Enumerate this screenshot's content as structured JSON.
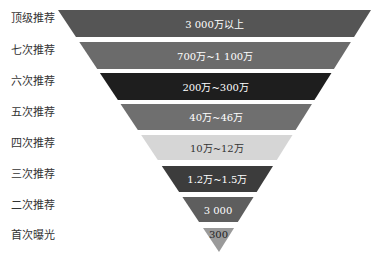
{
  "diagram": {
    "type": "funnel",
    "levels": [
      {
        "label": "顶级推荐",
        "value": "3 000万以上",
        "color": "#555555",
        "text_color": "#ffffff"
      },
      {
        "label": "七次推荐",
        "value": "700万~1 100万",
        "color": "#6b6b6b",
        "text_color": "#ffffff"
      },
      {
        "label": "六次推荐",
        "value": "200万~300万",
        "color": "#1e1e1e",
        "text_color": "#ffffff"
      },
      {
        "label": "五次推荐",
        "value": "40万~46万",
        "color": "#6f6f6f",
        "text_color": "#ffffff"
      },
      {
        "label": "四次推荐",
        "value": "10万~12万",
        "color": "#d6d6d6",
        "text_color": "#333333"
      },
      {
        "label": "三次推荐",
        "value": "1.2万~1.5万",
        "color": "#3c3c3c",
        "text_color": "#ffffff"
      },
      {
        "label": "二次推荐",
        "value": "3 000",
        "color": "#5e5e5e",
        "text_color": "#ffffff"
      },
      {
        "label": "首次曝光",
        "value": "300",
        "color": "#9a9a9a",
        "text_color": "#222222"
      }
    ]
  }
}
